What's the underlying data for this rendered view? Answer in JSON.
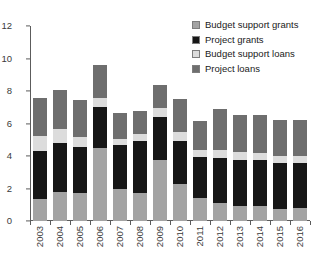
{
  "chart_data": {
    "type": "bar",
    "stacked": true,
    "title": "",
    "xlabel": "",
    "ylabel": "",
    "ylim": [
      0,
      12
    ],
    "yticks": [
      0,
      2,
      4,
      6,
      8,
      10,
      12
    ],
    "ytick_labels": [
      "0",
      "2",
      "4",
      "6",
      "8",
      "10",
      "12"
    ],
    "grid": false,
    "legend_position": "top-right",
    "categories": [
      "2003",
      "2004",
      "2005",
      "2006",
      "2007",
      "2008",
      "2009",
      "2010",
      "2011",
      "2012",
      "2013",
      "2014",
      "2015",
      "2016"
    ],
    "series": [
      {
        "name": "Budget support grants",
        "color": "#a3a3a3",
        "values": [
          1.35,
          1.8,
          1.7,
          4.5,
          2.0,
          1.75,
          3.75,
          2.3,
          1.4,
          1.1,
          0.95,
          0.9,
          0.75,
          0.8
        ]
      },
      {
        "name": "Project grants",
        "color": "#161616",
        "values": [
          2.95,
          3.0,
          2.85,
          2.5,
          2.65,
          3.15,
          2.65,
          2.6,
          2.55,
          2.75,
          2.8,
          2.85,
          2.8,
          2.8
        ]
      },
      {
        "name": "Budget support loans",
        "color": "#dcdcdc",
        "values": [
          0.95,
          0.85,
          0.65,
          0.6,
          0.4,
          0.45,
          0.55,
          0.55,
          0.45,
          0.55,
          0.5,
          0.45,
          0.45,
          0.4
        ]
      },
      {
        "name": "Project loans",
        "color": "#6e6e6e",
        "values": [
          2.35,
          2.4,
          2.25,
          2.0,
          1.6,
          1.45,
          1.4,
          2.05,
          1.75,
          2.5,
          2.3,
          2.3,
          2.2,
          2.2
        ]
      }
    ],
    "totals": [
      7.6,
      8.05,
      7.45,
      9.6,
      6.65,
      6.8,
      8.35,
      7.5,
      6.15,
      6.9,
      6.55,
      6.5,
      6.2,
      6.2
    ]
  },
  "legend": {
    "items": [
      {
        "label": "Budget support grants",
        "color": "#a3a3a3"
      },
      {
        "label": "Project grants",
        "color": "#161616"
      },
      {
        "label": "Budget support loans",
        "color": "#dcdcdc"
      },
      {
        "label": "Project loans",
        "color": "#6e6e6e"
      }
    ]
  },
  "axis": {
    "line_color": "#5c5c5c",
    "tick_text_color": "#3a3a3a"
  }
}
